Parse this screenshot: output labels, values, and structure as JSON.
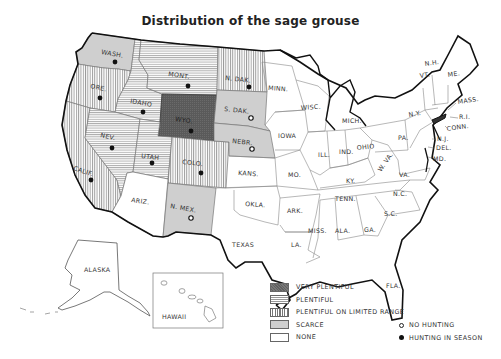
{
  "title": "Distribution of the sage grouse",
  "legend": {
    "categories": [
      {
        "key": "very_plentiful",
        "label": "VERY PLENTIFUL",
        "fill": "#606060"
      },
      {
        "key": "plentiful",
        "label": "PLENTIFUL",
        "pattern": "horizontal-lines"
      },
      {
        "key": "limited_range",
        "label": "PLENTIFUL ON LIMITED RANGE",
        "pattern": "vertical-lines"
      },
      {
        "key": "scarce",
        "label": "SCARCE",
        "fill": "#cfcfcf"
      },
      {
        "key": "none",
        "label": "NONE",
        "fill": "#ffffff"
      }
    ],
    "hunting": [
      {
        "key": "no_hunting",
        "label": "NO HUNTING",
        "symbol": "open-circle"
      },
      {
        "key": "hunting_in_season",
        "label": "HUNTING IN SEASON",
        "symbol": "filled-circle"
      }
    ]
  },
  "states": {
    "wash": {
      "label": "WASH.",
      "status": "scarce",
      "hunting": "hunting_in_season"
    },
    "ore": {
      "label": "ORE.",
      "status": "limited_range",
      "hunting": "hunting_in_season"
    },
    "calif": {
      "label": "CALIF.",
      "status": "limited_range",
      "hunting": "hunting_in_season"
    },
    "idaho": {
      "label": "IDAHO",
      "status": "plentiful",
      "hunting": "hunting_in_season"
    },
    "nev": {
      "label": "NEV.",
      "status": "plentiful",
      "hunting": "hunting_in_season"
    },
    "mont": {
      "label": "MONT.",
      "status": "plentiful",
      "hunting": "hunting_in_season"
    },
    "wyo": {
      "label": "WYO.",
      "status": "very_plentiful",
      "hunting": "hunting_in_season"
    },
    "utah": {
      "label": "UTAH",
      "status": "plentiful",
      "hunting": "hunting_in_season"
    },
    "colo": {
      "label": "COLO.",
      "status": "limited_range",
      "hunting": "hunting_in_season"
    },
    "ariz": {
      "label": "ARIZ.",
      "status": "none"
    },
    "n_mex": {
      "label": "N. MEX.",
      "status": "scarce",
      "hunting": "no_hunting"
    },
    "n_dak": {
      "label": "N. DAK.",
      "status": "limited_range",
      "hunting": "hunting_in_season"
    },
    "s_dak": {
      "label": "S. DAK.",
      "status": "scarce",
      "hunting": "no_hunting"
    },
    "nebr": {
      "label": "NEBR.",
      "status": "scarce",
      "hunting": "no_hunting"
    },
    "kans": {
      "label": "KANS.",
      "status": "none"
    },
    "okla": {
      "label": "OKLA.",
      "status": "none"
    },
    "texas": {
      "label": "TEXAS",
      "status": "none"
    },
    "minn": {
      "label": "MINN.",
      "status": "none"
    },
    "iowa": {
      "label": "IOWA",
      "status": "none"
    },
    "mo": {
      "label": "MO.",
      "status": "none"
    },
    "ark": {
      "label": "ARK.",
      "status": "none"
    },
    "la": {
      "label": "LA.",
      "status": "none"
    },
    "wisc": {
      "label": "WISC.",
      "status": "none"
    },
    "ill": {
      "label": "ILL.",
      "status": "none"
    },
    "mich": {
      "label": "MICH.",
      "status": "none"
    },
    "ind": {
      "label": "IND.",
      "status": "none"
    },
    "ohio": {
      "label": "OHIO",
      "status": "none"
    },
    "ky": {
      "label": "KY.",
      "status": "none"
    },
    "tenn": {
      "label": "TENN.",
      "status": "none"
    },
    "miss": {
      "label": "MISS.",
      "status": "none"
    },
    "ala": {
      "label": "ALA.",
      "status": "none"
    },
    "ga": {
      "label": "GA.",
      "status": "none"
    },
    "fla": {
      "label": "FLA.",
      "status": "none"
    },
    "sc": {
      "label": "S.C.",
      "status": "none"
    },
    "nc": {
      "label": "N.C.",
      "status": "none"
    },
    "va": {
      "label": "VA.",
      "status": "none"
    },
    "w_va": {
      "label": "W. VA.",
      "status": "none"
    },
    "pa": {
      "label": "PA.",
      "status": "none"
    },
    "ny": {
      "label": "N.Y.",
      "status": "none"
    },
    "vt": {
      "label": "VT.",
      "status": "none"
    },
    "nh": {
      "label": "N.H.",
      "status": "none"
    },
    "me": {
      "label": "ME.",
      "status": "none"
    },
    "mass": {
      "label": "MASS.",
      "status": "none"
    },
    "ri": {
      "label": "R.I.",
      "status": "none"
    },
    "conn": {
      "label": "CONN.",
      "status": "none"
    },
    "nj": {
      "label": "N.J.",
      "status": "none"
    },
    "del": {
      "label": "DEL.",
      "status": "none"
    },
    "md": {
      "label": "MD.",
      "status": "none"
    },
    "alaska": {
      "label": "ALASKA",
      "status": "none"
    },
    "hawaii": {
      "label": "HAWAII",
      "status": "none"
    }
  }
}
